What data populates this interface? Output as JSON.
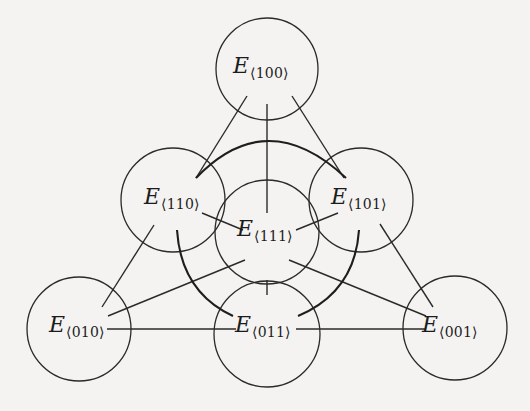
{
  "diagram": {
    "symbol": "E",
    "nodes": [
      {
        "id": "100",
        "label_sub": "⟨100⟩",
        "cx": 267,
        "cy": 69,
        "r": 51,
        "label_x": 233,
        "label_y": 55
      },
      {
        "id": "110",
        "label_sub": "⟨110⟩",
        "cx": 173,
        "cy": 200,
        "r": 52,
        "label_x": 144,
        "label_y": 186
      },
      {
        "id": "101",
        "label_sub": "⟨101⟩",
        "cx": 361,
        "cy": 200,
        "r": 52,
        "label_x": 331,
        "label_y": 186
      },
      {
        "id": "111",
        "label_sub": "⟨111⟩",
        "cx": 267,
        "cy": 232,
        "r": 52,
        "label_x": 237,
        "label_y": 218
      },
      {
        "id": "010",
        "label_sub": "⟨010⟩",
        "cx": 79,
        "cy": 329,
        "r": 52,
        "label_x": 49,
        "label_y": 314
      },
      {
        "id": "011",
        "label_sub": "⟨011⟩",
        "cx": 267,
        "cy": 334,
        "r": 53,
        "label_x": 235,
        "label_y": 314
      },
      {
        "id": "001",
        "label_sub": "⟨001⟩",
        "cx": 455,
        "cy": 328,
        "r": 52,
        "label_x": 422,
        "label_y": 314
      }
    ],
    "lines": [
      {
        "from": "100",
        "to": "110",
        "x1": 247,
        "y1": 96,
        "x2": 196,
        "y2": 178
      },
      {
        "from": "100",
        "to": "111",
        "x1": 267,
        "y1": 104,
        "x2": 267,
        "y2": 213
      },
      {
        "from": "100",
        "to": "101",
        "x1": 292,
        "y1": 96,
        "x2": 344,
        "y2": 178
      },
      {
        "from": "110",
        "to": "111",
        "x1": 202,
        "y1": 213,
        "x2": 243,
        "y2": 230
      },
      {
        "from": "101",
        "to": "111",
        "x1": 338,
        "y1": 213,
        "x2": 296,
        "y2": 230
      },
      {
        "from": "110",
        "to": "010",
        "x1": 154,
        "y1": 225,
        "x2": 102,
        "y2": 307
      },
      {
        "from": "101",
        "to": "001",
        "x1": 380,
        "y1": 224,
        "x2": 433,
        "y2": 307
      },
      {
        "from": "111",
        "to": "010",
        "x1": 245,
        "y1": 260,
        "x2": 108,
        "y2": 316
      },
      {
        "from": "111",
        "to": "001",
        "x1": 289,
        "y1": 260,
        "x2": 426,
        "y2": 316
      },
      {
        "from": "111",
        "to": "011",
        "x1": 267,
        "y1": 280,
        "x2": 267,
        "y2": 295
      },
      {
        "from": "010",
        "to": "011",
        "x1": 107,
        "y1": 329,
        "x2": 236,
        "y2": 329
      },
      {
        "from": "011",
        "to": "001",
        "x1": 296,
        "y1": 329,
        "x2": 425,
        "y2": 329
      }
    ],
    "arcs": [
      {
        "from": "110",
        "to": "101",
        "d": "M196,178 Q267,104 346,178"
      },
      {
        "from": "110",
        "to": "011",
        "d": "M177,230 Q181,292 233,316"
      },
      {
        "from": "101",
        "to": "011",
        "d": "M359,230 Q355,292 298,316"
      }
    ]
  }
}
